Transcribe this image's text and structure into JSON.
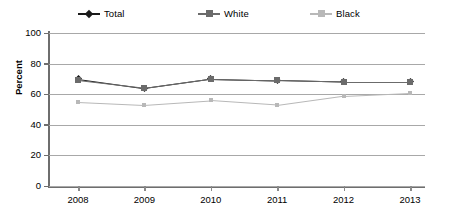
{
  "chart_data": {
    "type": "line",
    "title": "",
    "xlabel": "",
    "ylabel": "Percent",
    "categories": [
      "2008",
      "2009",
      "2010",
      "2011",
      "2012",
      "2013"
    ],
    "ylim": [
      0,
      100
    ],
    "yticks": [
      "0",
      "20",
      "40",
      "60",
      "80",
      "100"
    ],
    "grid": true,
    "legend_position": "top",
    "series": [
      {
        "name": "Total",
        "color": "#1a1a1a",
        "marker": "diamond",
        "values": [
          70,
          64,
          70,
          69,
          68,
          68
        ]
      },
      {
        "name": "White",
        "color": "#6b6b6b",
        "marker": "square",
        "values": [
          69,
          64,
          70,
          69,
          68,
          68
        ]
      },
      {
        "name": "Black",
        "color": "#b8b8b8",
        "marker": "square",
        "values": [
          55,
          53,
          56,
          53,
          59,
          61
        ]
      }
    ]
  },
  "legend": {
    "items": [
      {
        "label": "Total"
      },
      {
        "label": "White"
      },
      {
        "label": "Black"
      }
    ]
  },
  "axis": {
    "y_title": "Percent"
  }
}
